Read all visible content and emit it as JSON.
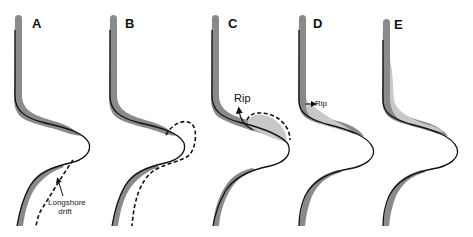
{
  "figure": {
    "panels": [
      {
        "id": "A",
        "letter": "A",
        "annotation": "Longshore drift",
        "annotation_lines": [
          "Longshore",
          "drift"
        ]
      },
      {
        "id": "B",
        "letter": "B"
      },
      {
        "id": "C",
        "letter": "C",
        "annotation": "Rip"
      },
      {
        "id": "D",
        "letter": "D",
        "annotation": "Rip"
      },
      {
        "id": "E",
        "letter": "E"
      }
    ],
    "colors": {
      "shoreline_band": "#8a8a8a",
      "sediment_fill": "#c8c8c8",
      "shoreline_line": "#111111",
      "dashed_line": "#111111",
      "background": "#ffffff"
    }
  }
}
